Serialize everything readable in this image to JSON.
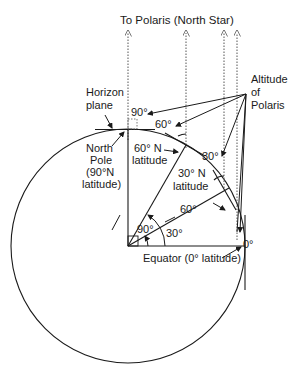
{
  "diagram": {
    "title": "To Polaris (North Star)",
    "labels": {
      "altitude_line1": "Altitude",
      "altitude_line2": "of",
      "altitude_line3": "Polaris",
      "horizon_line1": "Horizon",
      "horizon_line2": "plane",
      "north_pole_line1": "North",
      "north_pole_line2": "Pole",
      "north_pole_line3": "(90°N",
      "north_pole_line4": "latitude)",
      "lat60_line1": "60° N",
      "lat60_line2": "latitude",
      "lat30_line1": "30° N",
      "lat30_line2": "latitude",
      "equator": "Equator (0° latitude)"
    },
    "angles": {
      "alt_90": "90°",
      "alt_60": "60°",
      "alt_30": "30°",
      "alt_0": "0°",
      "center_90": "90°",
      "center_60": "60°",
      "center_30": "30°"
    },
    "colors": {
      "line": "#1a1a1a",
      "dotted": "#555555",
      "background": "#ffffff"
    }
  }
}
